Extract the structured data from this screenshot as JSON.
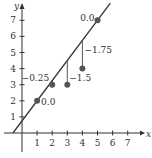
{
  "chart_data": {
    "type": "scatter",
    "title": "",
    "xlabel": "x",
    "ylabel": "y",
    "xlim": [
      -1,
      7.5
    ],
    "ylim": [
      -1,
      8
    ],
    "grid": false,
    "x_ticks": [
      "1",
      "2",
      "3",
      "4",
      "5",
      "6",
      "7"
    ],
    "y_ticks": [
      "1",
      "2",
      "3",
      "4",
      "5",
      "6",
      "7"
    ],
    "points": [
      {
        "x": 1,
        "y": 2,
        "residual_label": "0.0"
      },
      {
        "x": 2,
        "y": 3,
        "residual_label": "-0.25"
      },
      {
        "x": 3,
        "y": 3,
        "residual_label": "-1.5"
      },
      {
        "x": 4,
        "y": 4,
        "residual_label": "-1.75"
      },
      {
        "x": 5,
        "y": 7,
        "residual_label": "0.0"
      }
    ],
    "fit_line": {
      "slope": 1.25,
      "intercept": 0.75,
      "x_start": -0.6,
      "x_end": 5.85
    },
    "annotations": [
      "0.0",
      "-0.25",
      "-1.5",
      "-1.75",
      "0.0"
    ]
  },
  "colors": {
    "axis": "#333333",
    "line": "#333333",
    "point": "#555555",
    "residual": "#555555"
  }
}
